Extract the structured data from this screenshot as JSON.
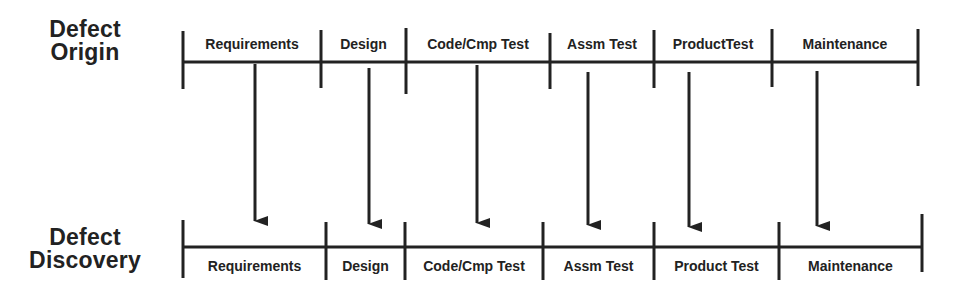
{
  "origin": {
    "title_line1": "Defect",
    "title_line2": "Origin",
    "phases": [
      {
        "label": "Requirements",
        "x0": 183,
        "x1": 321
      },
      {
        "label": "Design",
        "x0": 321,
        "x1": 406
      },
      {
        "label": "Code/Cmp Test",
        "x0": 406,
        "x1": 550
      },
      {
        "label": "Assm Test",
        "x0": 550,
        "x1": 654
      },
      {
        "label": "ProductTest",
        "x0": 654,
        "x1": 772
      },
      {
        "label": "Maintenance",
        "x0": 772,
        "x1": 918
      }
    ]
  },
  "discovery": {
    "title_line1": "Defect",
    "title_line2": "Discovery",
    "phases": [
      {
        "label": "Requirements",
        "x0": 183,
        "x1": 326
      },
      {
        "label": "Design",
        "x0": 326,
        "x1": 405
      },
      {
        "label": "Code/Cmp Test",
        "x0": 405,
        "x1": 543
      },
      {
        "label": "Assm Test",
        "x0": 543,
        "x1": 654
      },
      {
        "label": "Product Test",
        "x0": 654,
        "x1": 779
      },
      {
        "label": "Maintenance",
        "x0": 779,
        "x1": 922
      }
    ]
  },
  "arrows": [
    {
      "from": "Requirements",
      "to": "Requirements",
      "x": 255
    },
    {
      "from": "Design",
      "to": "Design",
      "x": 369
    },
    {
      "from": "Code/Cmp Test",
      "to": "Code/Cmp Test",
      "x": 477
    },
    {
      "from": "Assm Test",
      "to": "Assm Test",
      "x": 588
    },
    {
      "from": "ProductTest",
      "to": "Product Test",
      "x": 689
    },
    {
      "from": "Maintenance",
      "to": "Maintenance",
      "x": 817
    }
  ],
  "colors": {
    "ink": "#222222",
    "background": "#ffffff"
  }
}
